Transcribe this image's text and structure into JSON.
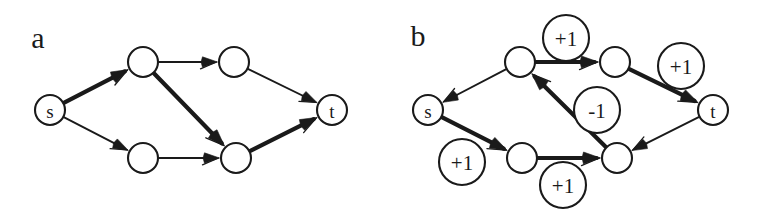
{
  "figure": {
    "width": 758,
    "height": 216,
    "background": "#ffffff",
    "ink_color": "#1a1a1a"
  },
  "panels": [
    {
      "letter": "a",
      "letter_pos": {
        "x": 38,
        "y": 37
      },
      "nodes": [
        {
          "id": "s",
          "label": "s",
          "x": 50,
          "y": 110,
          "r": 15
        },
        {
          "id": "v1",
          "label": "",
          "x": 143,
          "y": 62,
          "r": 15
        },
        {
          "id": "v2",
          "label": "",
          "x": 234,
          "y": 62,
          "r": 15
        },
        {
          "id": "v3",
          "label": "",
          "x": 143,
          "y": 158,
          "r": 15
        },
        {
          "id": "v4",
          "label": "",
          "x": 236,
          "y": 158,
          "r": 15
        },
        {
          "id": "t",
          "label": "t",
          "x": 332,
          "y": 110,
          "r": 15
        }
      ],
      "edges": [
        {
          "from": "s",
          "to": "v1",
          "weight": "thick"
        },
        {
          "from": "v1",
          "to": "v2",
          "weight": "thin"
        },
        {
          "from": "v1",
          "to": "v4",
          "weight": "thick"
        },
        {
          "from": "s",
          "to": "v3",
          "weight": "thin"
        },
        {
          "from": "v3",
          "to": "v4",
          "weight": "thin"
        },
        {
          "from": "v2",
          "to": "t",
          "weight": "thin"
        },
        {
          "from": "v4",
          "to": "t",
          "weight": "thick"
        }
      ],
      "edge_labels": []
    },
    {
      "letter": "b",
      "letter_pos": {
        "x": 418,
        "y": 35
      },
      "nodes": [
        {
          "id": "s",
          "label": "s",
          "x": 428,
          "y": 110,
          "r": 15
        },
        {
          "id": "v1",
          "label": "",
          "x": 520,
          "y": 62,
          "r": 15
        },
        {
          "id": "v2",
          "label": "",
          "x": 615,
          "y": 62,
          "r": 15
        },
        {
          "id": "v3",
          "label": "",
          "x": 522,
          "y": 158,
          "r": 15
        },
        {
          "id": "v4",
          "label": "",
          "x": 617,
          "y": 158,
          "r": 15
        },
        {
          "id": "t",
          "label": "t",
          "x": 713,
          "y": 110,
          "r": 15
        }
      ],
      "edges": [
        {
          "from": "v1",
          "to": "s",
          "weight": "thin"
        },
        {
          "from": "v1",
          "to": "v2",
          "weight": "thick"
        },
        {
          "from": "v4",
          "to": "v1",
          "weight": "thick"
        },
        {
          "from": "s",
          "to": "v3",
          "weight": "thick"
        },
        {
          "from": "v3",
          "to": "v4",
          "weight": "thick"
        },
        {
          "from": "v2",
          "to": "t",
          "weight": "thick"
        },
        {
          "from": "t",
          "to": "v4",
          "weight": "thin"
        }
      ],
      "edge_labels": [
        {
          "text": "+1",
          "x": 566,
          "y": 38,
          "r": 23
        },
        {
          "text": "+1",
          "x": 681,
          "y": 66,
          "r": 23
        },
        {
          "text": "-1",
          "x": 597,
          "y": 110,
          "r": 23
        },
        {
          "text": "+1",
          "x": 462,
          "y": 162,
          "r": 23
        },
        {
          "text": "+1",
          "x": 563,
          "y": 185,
          "r": 23
        }
      ]
    }
  ]
}
